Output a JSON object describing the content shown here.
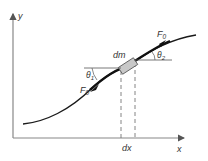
{
  "diagram": {
    "axes": {
      "x_label": "x",
      "y_label": "y"
    },
    "element": {
      "mass_label": "dm",
      "width_label": "dx"
    },
    "forces": {
      "upper_force_label": "F",
      "upper_force_sub": "0",
      "lower_force_label": "F",
      "lower_force_sub": "0"
    },
    "angles": {
      "upper_angle_label": "θ",
      "upper_angle_sub": "2",
      "lower_angle_label": "θ",
      "lower_angle_sub": "1"
    },
    "colors": {
      "axis": "#888888",
      "curve": "#1a1a1a",
      "text": "#333333",
      "element_fill": "#c8c8c8",
      "dashed": "#777777"
    }
  }
}
